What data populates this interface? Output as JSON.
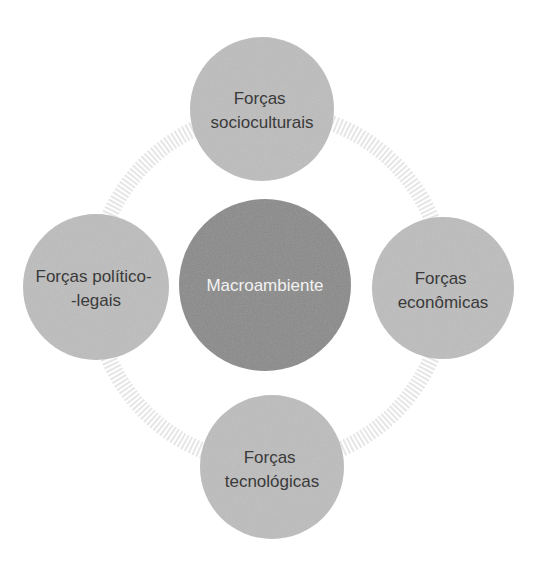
{
  "diagram": {
    "title": "Macroambiente",
    "center": {
      "label": "Macroambiente",
      "color": "#8a8a8a",
      "text_color": "#f2f2f2"
    },
    "nodes": [
      {
        "id": "socioculturais",
        "lines": [
          "Forças",
          "socioculturais"
        ]
      },
      {
        "id": "economicas",
        "lines": [
          "Forças",
          "econômicas"
        ]
      },
      {
        "id": "tecnologicas",
        "lines": [
          "Forças",
          "tecnológicas"
        ]
      },
      {
        "id": "politico-legais",
        "lines": [
          "Forças político-",
          "-legais"
        ]
      }
    ],
    "colors": {
      "node_fill": "#bdbdbd",
      "node_text": "#3a3a3a",
      "ring": "#e3e3e3"
    }
  }
}
